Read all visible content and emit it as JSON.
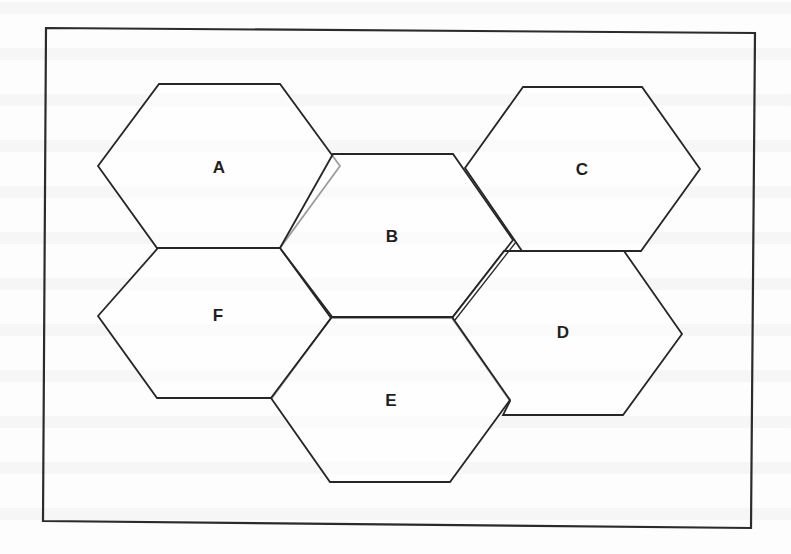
{
  "figure": {
    "type": "cellular-network-hexagon-diagram",
    "colors": {
      "stroke": "#262626",
      "label": "#1f1f1f",
      "background": "#ffffff"
    },
    "cells": [
      {
        "id": "A",
        "label": "A"
      },
      {
        "id": "B",
        "label": "B"
      },
      {
        "id": "C",
        "label": "C"
      },
      {
        "id": "D",
        "label": "D"
      },
      {
        "id": "E",
        "label": "E"
      },
      {
        "id": "F",
        "label": "F"
      }
    ]
  }
}
